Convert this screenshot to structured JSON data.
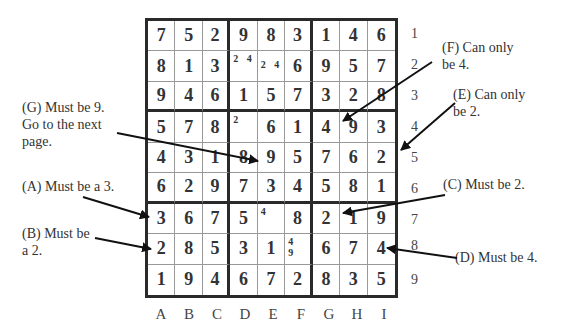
{
  "puzzle": {
    "rows": [
      [
        "7",
        "5",
        "2",
        "9",
        "8",
        "3",
        "1",
        "4",
        "6"
      ],
      [
        "8",
        "1",
        "3",
        "",
        "",
        "6",
        "9",
        "5",
        "7"
      ],
      [
        "9",
        "4",
        "6",
        "1",
        "5",
        "7",
        "3",
        "2",
        "8"
      ],
      [
        "5",
        "7",
        "8",
        "",
        "6",
        "1",
        "4",
        "9",
        "3"
      ],
      [
        "4",
        "3",
        "1",
        "8",
        "9",
        "5",
        "7",
        "6",
        "2"
      ],
      [
        "6",
        "2",
        "9",
        "7",
        "3",
        "4",
        "5",
        "8",
        "1"
      ],
      [
        "3",
        "6",
        "7",
        "5",
        "",
        "8",
        "2",
        "1",
        "9"
      ],
      [
        "2",
        "8",
        "5",
        "3",
        "1",
        "",
        "6",
        "7",
        "4"
      ],
      [
        "1",
        "9",
        "4",
        "6",
        "7",
        "2",
        "8",
        "3",
        "5"
      ]
    ],
    "candidates": {
      "r2c4": "2 4",
      "r2c5": "2 4",
      "r4c4": "2",
      "r7c5": "4",
      "r8c6": "4 9"
    }
  },
  "row_labels": [
    "1",
    "2",
    "3",
    "4",
    "5",
    "6",
    "7",
    "8",
    "9"
  ],
  "col_labels": [
    "A",
    "B",
    "C",
    "D",
    "E",
    "F",
    "G",
    "H",
    "I"
  ],
  "annotations": {
    "G": "(G) Must be 9.\nGo to the next\npage.",
    "A": "(A) Must be a 3.",
    "B": "(B) Must be\na 2.",
    "F": "(F) Can only\nbe 4.",
    "E": "(E) Can only\nbe 2.",
    "C": "(C) Must be 2.",
    "D": "(D) Must be 4."
  },
  "colors": {
    "grid": "#2a2a2a",
    "thin": "#999999",
    "text": "#333333",
    "arrow": "#111111"
  }
}
